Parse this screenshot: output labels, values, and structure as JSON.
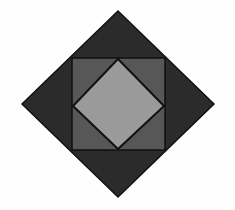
{
  "diagram": {
    "type": "nested-squares",
    "canvas": {
      "width": 235,
      "height": 210,
      "background": "#fefefe"
    },
    "shapes": [
      {
        "name": "outer-diamond",
        "points": "118,11 214,104 118,197 22,104",
        "fill": "#2b2b2b",
        "stroke": "#111111"
      },
      {
        "name": "middle-square",
        "points": "72,58 165,58 165,150 72,150",
        "fill": "#575757",
        "stroke": "#111111"
      },
      {
        "name": "inner-diamond",
        "points": "118,59 164,106 118,149 73,106",
        "fill": "#9a9a9a",
        "stroke": "#111111"
      }
    ]
  }
}
